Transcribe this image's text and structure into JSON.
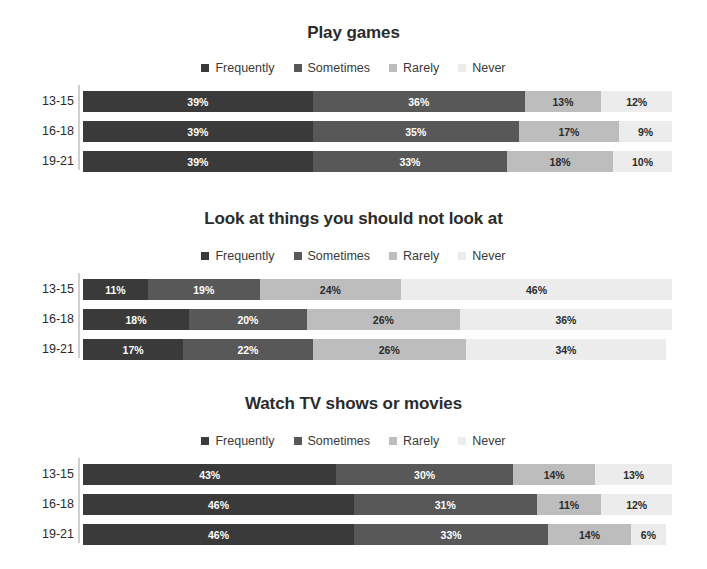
{
  "colors": {
    "frequently": "#3a3a3a",
    "sometimes": "#585858",
    "rarely": "#bdbdbd",
    "never": "#ececec",
    "label_on_dark": "#ffffff",
    "label_on_light": "#2b2b2b",
    "axis": "#cfcfcf",
    "background": "#ffffff",
    "text": "#2b2b2b"
  },
  "legend": {
    "items": [
      {
        "label": "Frequently",
        "color": "#3a3a3a"
      },
      {
        "label": "Sometimes",
        "color": "#585858"
      },
      {
        "label": "Rarely",
        "color": "#bdbdbd"
      },
      {
        "label": "Never",
        "color": "#ececec"
      }
    ]
  },
  "chart_data": [
    {
      "type": "bar",
      "orientation": "horizontal",
      "stacked": true,
      "stacked_percent": true,
      "title": "Play games",
      "xlabel": "",
      "ylabel": "",
      "xlim": [
        0,
        100
      ],
      "grid": false,
      "legend_position": "top-center",
      "categories": [
        "13-15",
        "16-18",
        "19-21"
      ],
      "series": [
        {
          "name": "Frequently",
          "color": "#3a3a3a",
          "values": [
            39,
            39,
            39
          ]
        },
        {
          "name": "Sometimes",
          "color": "#585858",
          "values": [
            36,
            35,
            33
          ]
        },
        {
          "name": "Rarely",
          "color": "#bdbdbd",
          "values": [
            13,
            17,
            18
          ]
        },
        {
          "name": "Never",
          "color": "#ececec",
          "values": [
            12,
            9,
            10
          ]
        }
      ],
      "data_labels": [
        [
          "39%",
          "36%",
          "13%",
          "12%"
        ],
        [
          "39%",
          "35%",
          "17%",
          "9%"
        ],
        [
          "39%",
          "33%",
          "18%",
          "10%"
        ]
      ]
    },
    {
      "type": "bar",
      "orientation": "horizontal",
      "stacked": true,
      "stacked_percent": true,
      "title": "Look at things you should not look at",
      "xlabel": "",
      "ylabel": "",
      "xlim": [
        0,
        100
      ],
      "grid": false,
      "legend_position": "top-center",
      "categories": [
        "13-15",
        "16-18",
        "19-21"
      ],
      "series": [
        {
          "name": "Frequently",
          "color": "#3a3a3a",
          "values": [
            11,
            18,
            17
          ]
        },
        {
          "name": "Sometimes",
          "color": "#585858",
          "values": [
            19,
            20,
            22
          ]
        },
        {
          "name": "Rarely",
          "color": "#bdbdbd",
          "values": [
            24,
            26,
            26
          ]
        },
        {
          "name": "Never",
          "color": "#ececec",
          "values": [
            46,
            36,
            34
          ]
        }
      ],
      "data_labels": [
        [
          "11%",
          "19%",
          "24%",
          "46%"
        ],
        [
          "18%",
          "20%",
          "26%",
          "36%"
        ],
        [
          "17%",
          "22%",
          "26%",
          "34%"
        ]
      ]
    },
    {
      "type": "bar",
      "orientation": "horizontal",
      "stacked": true,
      "stacked_percent": true,
      "title": "Watch TV shows or movies",
      "xlabel": "",
      "ylabel": "",
      "xlim": [
        0,
        100
      ],
      "grid": false,
      "legend_position": "top-center",
      "categories": [
        "13-15",
        "16-18",
        "19-21"
      ],
      "series": [
        {
          "name": "Frequently",
          "color": "#3a3a3a",
          "values": [
            43,
            46,
            46
          ]
        },
        {
          "name": "Sometimes",
          "color": "#585858",
          "values": [
            30,
            31,
            33
          ]
        },
        {
          "name": "Rarely",
          "color": "#bdbdbd",
          "values": [
            14,
            11,
            14
          ]
        },
        {
          "name": "Never",
          "color": "#ececec",
          "values": [
            13,
            12,
            6
          ]
        }
      ],
      "data_labels": [
        [
          "43%",
          "30%",
          "14%",
          "13%"
        ],
        [
          "46%",
          "31%",
          "11%",
          "12%"
        ],
        [
          "46%",
          "33%",
          "14%",
          "6%"
        ]
      ]
    }
  ]
}
